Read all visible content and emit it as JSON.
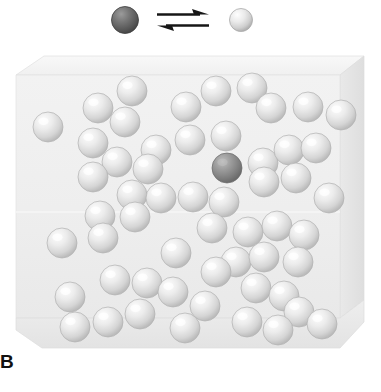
{
  "figure": {
    "panel_label": "B",
    "caption_note": "",
    "background_color": "#ffffff"
  },
  "legend": {
    "name": "equilibrium-legend",
    "left_species": {
      "name": "dark-sphere-species",
      "label": "",
      "cx": 125,
      "cy": 20,
      "r": 13.5,
      "fill_light": "#8f8f8f",
      "fill_mid": "#6e6e6e",
      "fill_dark": "#4a4a4a",
      "outline": "#3a3a3a"
    },
    "right_species": {
      "name": "light-sphere-species",
      "label": "",
      "cx": 241,
      "cy": 20,
      "r": 11.5,
      "fill_light": "#fdfdfd",
      "fill_mid": "#e2e2e2",
      "fill_dark": "#b9b9b9",
      "outline": "#a8a8a8"
    },
    "arrow": {
      "name": "equilibrium-arrow",
      "symbol": "⇌",
      "color": "#1a1a1a",
      "top_arrow_direction": "right",
      "bottom_arrow_direction": "left",
      "x_start": 158,
      "x_end": 208,
      "y_top": 15,
      "y_bottom": 25
    }
  },
  "box": {
    "name": "container-box",
    "face_color": "#efefef",
    "top_face_color": "#f6f6f6",
    "right_face_color": "#e4e4e4",
    "bottom_face_color": "#ececec",
    "edge_color": "#dcdcdc",
    "front_top_left": [
      16,
      75
    ],
    "front_top_right": [
      340,
      75
    ],
    "front_bottom_left": [
      16,
      318
    ],
    "front_bottom_right": [
      340,
      318
    ],
    "back_top_left": [
      44,
      56
    ],
    "back_top_right": [
      364,
      56
    ],
    "back_bottom_right": [
      364,
      300
    ],
    "bottom_front_y": 348
  },
  "particles": {
    "name": "particle-field",
    "total_count": 56,
    "dark_count": 1,
    "light_count": 55,
    "light_style": {
      "fill_light": "#fcfcfc",
      "fill_mid": "#e3e3e3",
      "fill_dark": "#bdbdbd",
      "outline": "#b0b0b0"
    },
    "dark_style": {
      "fill_light": "#b5b5b5",
      "fill_mid": "#8e8e8e",
      "fill_dark": "#6d6d6d",
      "outline": "#6a6a6a"
    },
    "items": [
      {
        "cx": 48,
        "cy": 127,
        "r": 15,
        "type": "light"
      },
      {
        "cx": 98,
        "cy": 108,
        "r": 15,
        "type": "light"
      },
      {
        "cx": 132,
        "cy": 91,
        "r": 15,
        "type": "light"
      },
      {
        "cx": 125,
        "cy": 122,
        "r": 15,
        "type": "light"
      },
      {
        "cx": 93,
        "cy": 143,
        "r": 15,
        "type": "light"
      },
      {
        "cx": 186,
        "cy": 107,
        "r": 15,
        "type": "light"
      },
      {
        "cx": 216,
        "cy": 91,
        "r": 15,
        "type": "light"
      },
      {
        "cx": 252,
        "cy": 88,
        "r": 15,
        "type": "light"
      },
      {
        "cx": 271,
        "cy": 108,
        "r": 15,
        "type": "light"
      },
      {
        "cx": 308,
        "cy": 107,
        "r": 15,
        "type": "light"
      },
      {
        "cx": 341,
        "cy": 115,
        "r": 15,
        "type": "light"
      },
      {
        "cx": 156,
        "cy": 150,
        "r": 15,
        "type": "light"
      },
      {
        "cx": 190,
        "cy": 140,
        "r": 15,
        "type": "light"
      },
      {
        "cx": 226,
        "cy": 136,
        "r": 15,
        "type": "light"
      },
      {
        "cx": 148,
        "cy": 169,
        "r": 15,
        "type": "light"
      },
      {
        "cx": 117,
        "cy": 162,
        "r": 15,
        "type": "light"
      },
      {
        "cx": 93,
        "cy": 177,
        "r": 15,
        "type": "light"
      },
      {
        "cx": 227,
        "cy": 168,
        "r": 15,
        "type": "dark"
      },
      {
        "cx": 263,
        "cy": 163,
        "r": 15,
        "type": "light"
      },
      {
        "cx": 289,
        "cy": 150,
        "r": 15,
        "type": "light"
      },
      {
        "cx": 316,
        "cy": 148,
        "r": 15,
        "type": "light"
      },
      {
        "cx": 264,
        "cy": 182,
        "r": 15,
        "type": "light"
      },
      {
        "cx": 296,
        "cy": 178,
        "r": 15,
        "type": "light"
      },
      {
        "cx": 132,
        "cy": 195,
        "r": 15,
        "type": "light"
      },
      {
        "cx": 161,
        "cy": 198,
        "r": 15,
        "type": "light"
      },
      {
        "cx": 193,
        "cy": 197,
        "r": 15,
        "type": "light"
      },
      {
        "cx": 224,
        "cy": 202,
        "r": 15,
        "type": "light"
      },
      {
        "cx": 329,
        "cy": 198,
        "r": 15,
        "type": "light"
      },
      {
        "cx": 100,
        "cy": 216,
        "r": 15,
        "type": "light"
      },
      {
        "cx": 135,
        "cy": 217,
        "r": 15,
        "type": "light"
      },
      {
        "cx": 212,
        "cy": 228,
        "r": 15,
        "type": "light"
      },
      {
        "cx": 248,
        "cy": 232,
        "r": 15,
        "type": "light"
      },
      {
        "cx": 277,
        "cy": 226,
        "r": 15,
        "type": "light"
      },
      {
        "cx": 304,
        "cy": 235,
        "r": 15,
        "type": "light"
      },
      {
        "cx": 62,
        "cy": 243,
        "r": 15,
        "type": "light"
      },
      {
        "cx": 103,
        "cy": 238,
        "r": 15,
        "type": "light"
      },
      {
        "cx": 176,
        "cy": 253,
        "r": 15,
        "type": "light"
      },
      {
        "cx": 236,
        "cy": 262,
        "r": 15,
        "type": "light"
      },
      {
        "cx": 264,
        "cy": 257,
        "r": 15,
        "type": "light"
      },
      {
        "cx": 298,
        "cy": 262,
        "r": 15,
        "type": "light"
      },
      {
        "cx": 216,
        "cy": 272,
        "r": 15,
        "type": "light"
      },
      {
        "cx": 115,
        "cy": 280,
        "r": 15,
        "type": "light"
      },
      {
        "cx": 147,
        "cy": 283,
        "r": 15,
        "type": "light"
      },
      {
        "cx": 173,
        "cy": 292,
        "r": 15,
        "type": "light"
      },
      {
        "cx": 70,
        "cy": 297,
        "r": 15,
        "type": "light"
      },
      {
        "cx": 256,
        "cy": 288,
        "r": 15,
        "type": "light"
      },
      {
        "cx": 284,
        "cy": 296,
        "r": 15,
        "type": "light"
      },
      {
        "cx": 299,
        "cy": 312,
        "r": 15,
        "type": "light"
      },
      {
        "cx": 205,
        "cy": 306,
        "r": 15,
        "type": "light"
      },
      {
        "cx": 140,
        "cy": 314,
        "r": 15,
        "type": "light"
      },
      {
        "cx": 108,
        "cy": 322,
        "r": 15,
        "type": "light"
      },
      {
        "cx": 75,
        "cy": 327,
        "r": 15,
        "type": "light"
      },
      {
        "cx": 185,
        "cy": 328,
        "r": 15,
        "type": "light"
      },
      {
        "cx": 247,
        "cy": 322,
        "r": 15,
        "type": "light"
      },
      {
        "cx": 278,
        "cy": 330,
        "r": 15,
        "type": "light"
      },
      {
        "cx": 322,
        "cy": 324,
        "r": 15,
        "type": "light"
      }
    ]
  }
}
